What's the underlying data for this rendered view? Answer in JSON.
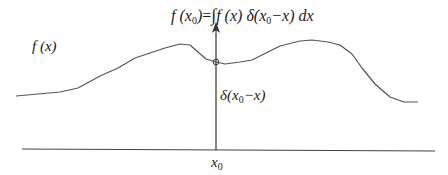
{
  "diagram": {
    "title_formula": {
      "lhs": "f (x",
      "lhs_sub": "0",
      "lhs_close": ")",
      "equals": "=",
      "integral": "∫",
      "integrand_f": "f (x)",
      "delta": "δ(x",
      "delta_sub": "0",
      "delta_rest": "−x)",
      "dx": "dx"
    },
    "curve_label": "f (x)",
    "delta_label": {
      "prefix": "δ(x",
      "sub": "0",
      "suffix": "−x)"
    },
    "axis_label": {
      "text": "x",
      "sub": "0"
    },
    "colors": {
      "curve": "#555555",
      "axis": "#444444",
      "arrow": "#333333",
      "text": "#222222"
    },
    "curve_points": [
      [
        16,
        96
      ],
      [
        60,
        92
      ],
      [
        78,
        88
      ],
      [
        100,
        76
      ],
      [
        118,
        68
      ],
      [
        135,
        58
      ],
      [
        150,
        53
      ],
      [
        165,
        48
      ],
      [
        180,
        44
      ],
      [
        190,
        45
      ],
      [
        198,
        52
      ],
      [
        206,
        59
      ],
      [
        216,
        62
      ],
      [
        225,
        64
      ],
      [
        240,
        62
      ],
      [
        252,
        60
      ],
      [
        268,
        52
      ],
      [
        280,
        46
      ],
      [
        300,
        41
      ],
      [
        312,
        40
      ],
      [
        328,
        42
      ],
      [
        340,
        45
      ],
      [
        352,
        54
      ],
      [
        362,
        68
      ],
      [
        375,
        84
      ],
      [
        390,
        97
      ],
      [
        404,
        102
      ],
      [
        418,
        102
      ]
    ]
  }
}
